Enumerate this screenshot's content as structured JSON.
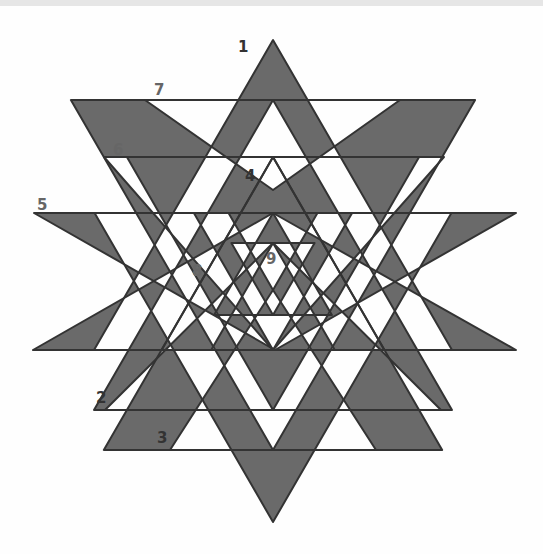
{
  "diagram": {
    "fill_color": "#6a6a6a",
    "stroke_color": "#333333",
    "background": "#ffffff",
    "labels": [
      {
        "id": "1",
        "text": "1",
        "color": "#333333"
      },
      {
        "id": "2",
        "text": "2",
        "color": "#333333"
      },
      {
        "id": "3",
        "text": "3",
        "color": "#333333"
      },
      {
        "id": "4",
        "text": "4",
        "color": "#333333"
      },
      {
        "id": "5",
        "text": "5",
        "color": "#666666"
      },
      {
        "id": "6",
        "text": "6",
        "color": "#666666"
      },
      {
        "id": "7",
        "text": "7",
        "color": "#666666"
      },
      {
        "id": "8",
        "text": "8",
        "color": "#666666"
      },
      {
        "id": "9",
        "text": "9",
        "color": "#666666"
      }
    ]
  }
}
